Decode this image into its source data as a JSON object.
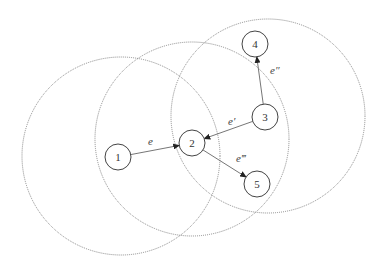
{
  "diagram": {
    "colors": {
      "range_circle": "#8a8a8a",
      "node_stroke": "#444444",
      "edge": "#666666",
      "text": "#333333"
    },
    "range_circles": [
      {
        "id": "range-node-1",
        "cx": 121,
        "cy": 156,
        "r": 99
      },
      {
        "id": "range-node-2",
        "cx": 192,
        "cy": 139,
        "r": 97
      },
      {
        "id": "range-node-3",
        "cx": 268,
        "cy": 116,
        "r": 97
      }
    ],
    "nodes": [
      {
        "id": "1",
        "label": "1",
        "cx": 118,
        "cy": 157,
        "r": 13
      },
      {
        "id": "2",
        "label": "2",
        "cx": 192,
        "cy": 143,
        "r": 13
      },
      {
        "id": "3",
        "label": "3",
        "cx": 265,
        "cy": 117,
        "r": 13
      },
      {
        "id": "4",
        "label": "4",
        "cx": 255,
        "cy": 44,
        "r": 13
      },
      {
        "id": "5",
        "label": "5",
        "cx": 257,
        "cy": 184,
        "r": 13
      }
    ],
    "edges": [
      {
        "id": "e",
        "from": "1",
        "to": "2",
        "label": "e",
        "lx": 148,
        "ly": 145
      },
      {
        "id": "e1",
        "from": "3",
        "to": "2",
        "label": "e′",
        "lx": 228,
        "ly": 125
      },
      {
        "id": "e2",
        "from": "3",
        "to": "4",
        "label": "e″",
        "lx": 270,
        "ly": 74
      },
      {
        "id": "e3",
        "from": "2",
        "to": "5",
        "label": "e‴",
        "lx": 236,
        "ly": 162
      }
    ]
  }
}
